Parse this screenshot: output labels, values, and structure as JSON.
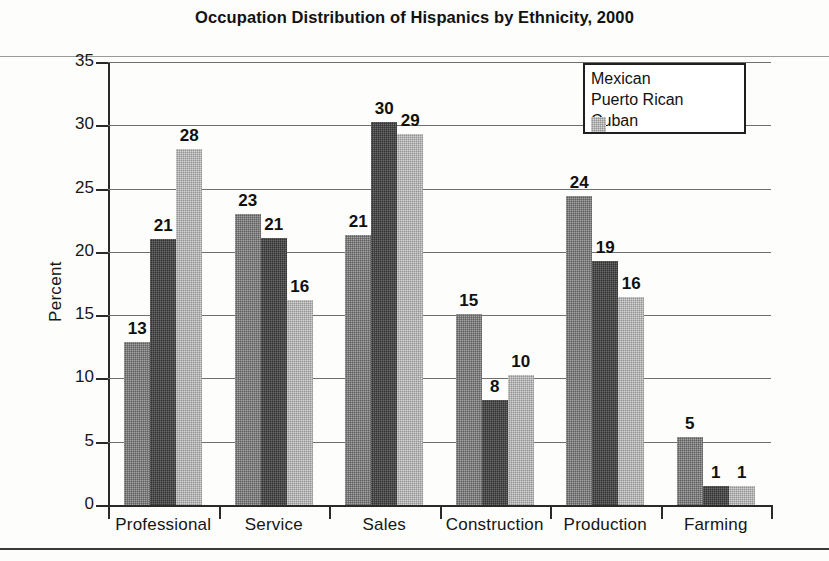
{
  "chart_data": {
    "type": "bar",
    "title": "Occupation Distribution of Hispanics by Ethnicity, 2000",
    "xlabel": "",
    "ylabel": "Percent",
    "ylim": [
      0,
      35
    ],
    "yticks": [
      0,
      5,
      10,
      15,
      20,
      25,
      30,
      35
    ],
    "grid": true,
    "legend_position": "top-right",
    "categories": [
      "Professional",
      "Service",
      "Sales",
      "Construction",
      "Production",
      "Farming"
    ],
    "series": [
      {
        "name": "Mexican",
        "color": "#7d7d7d",
        "values": [
          13,
          23,
          21,
          15,
          24,
          5
        ],
        "labels": [
          "13",
          "23",
          "21",
          "15",
          "24",
          "5"
        ],
        "plot_heights": [
          12.9,
          23.0,
          21.3,
          15.1,
          24.4,
          5.4
        ]
      },
      {
        "name": "Puerto Rican",
        "color": "#4a4a4a",
        "values": [
          21,
          21,
          30,
          8,
          19,
          1
        ],
        "labels": [
          "21",
          "21",
          "30",
          "8",
          "19",
          "1"
        ],
        "plot_heights": [
          21.0,
          21.1,
          30.3,
          8.3,
          19.3,
          1.5
        ]
      },
      {
        "name": "Cuban",
        "color": "#b3b3b3",
        "values": [
          28,
          16,
          29,
          10,
          16,
          1
        ],
        "labels": [
          "28",
          "16",
          "29",
          "10",
          "16",
          "1"
        ],
        "plot_heights": [
          28.1,
          16.2,
          29.3,
          10.3,
          16.4,
          1.5
        ]
      }
    ]
  },
  "axis": {
    "y_tick_labels": [
      "35",
      "30",
      "25",
      "20",
      "15",
      "10",
      "5",
      "0"
    ],
    "y_title": "Percent"
  },
  "legend": {
    "items": [
      {
        "label": "Mexican"
      },
      {
        "label": "Puerto Rican"
      },
      {
        "label": "Cuban"
      }
    ]
  }
}
